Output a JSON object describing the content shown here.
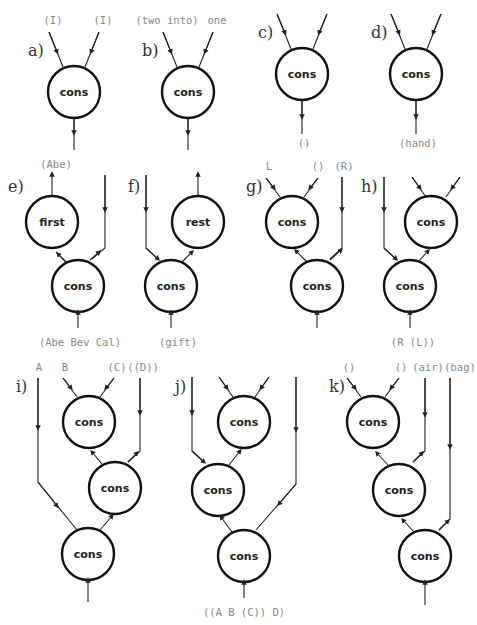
{
  "diagram": {
    "node_default_label": "cons",
    "panels": [
      {
        "id": "a",
        "label": "a)",
        "inputs": [
          "(I)",
          "(I)"
        ],
        "output": ""
      },
      {
        "id": "b",
        "label": "b)",
        "inputs": [
          "(two into)",
          "one"
        ],
        "output": ""
      },
      {
        "id": "c",
        "label": "c)",
        "inputs": [
          "",
          ""
        ],
        "output": "()"
      },
      {
        "id": "d",
        "label": "d)",
        "inputs": [
          "",
          ""
        ],
        "output": "(hand)"
      },
      {
        "id": "e",
        "label": "e)",
        "nodes": [
          "first",
          "cons"
        ],
        "top_output": "(Abe)",
        "bottom_input": "(Abe Bev Cal)"
      },
      {
        "id": "f",
        "label": "f)",
        "nodes": [
          "rest",
          "cons"
        ],
        "bottom_input": "(gift)"
      },
      {
        "id": "g",
        "label": "g)",
        "nodes": [
          "cons",
          "cons"
        ],
        "inputs": [
          "L",
          "()",
          "(R)"
        ]
      },
      {
        "id": "h",
        "label": "h)",
        "nodes": [
          "cons",
          "cons"
        ],
        "bottom_input": "(R (L))"
      },
      {
        "id": "i",
        "label": "i)",
        "nodes": [
          "cons",
          "cons",
          "cons"
        ],
        "inputs": [
          "A",
          "B",
          "(C)",
          "((D))"
        ]
      },
      {
        "id": "j",
        "label": "j)",
        "nodes": [
          "cons",
          "cons",
          "cons"
        ],
        "bottom_input": "((A B (C)) D)"
      },
      {
        "id": "k",
        "label": "k)",
        "nodes": [
          "cons",
          "cons",
          "cons"
        ],
        "inputs": [
          "()",
          "()",
          "(air)",
          "(bag)"
        ]
      }
    ]
  }
}
